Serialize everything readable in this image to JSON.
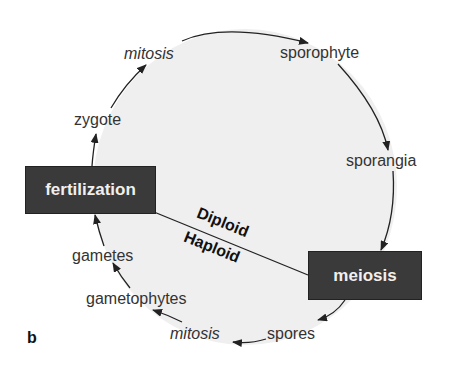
{
  "diagram": {
    "panel_label": "b",
    "process_boxes": {
      "fertilization": "fertilization",
      "meiosis": "meiosis"
    },
    "divider_labels": {
      "upper": "Diploid",
      "lower": "Haploid"
    },
    "cycle_labels": {
      "mitosis_top": "mitosis",
      "sporophyte": "sporophyte",
      "sporangia": "sporangia",
      "spores": "spores",
      "mitosis_bottom": "mitosis",
      "gametophytes": "gametophytes",
      "gametes": "gametes",
      "zygote": "zygote"
    },
    "colors": {
      "circle_fill": "#efefef",
      "box_fill": "#3a3a3a",
      "box_text": "#f0f0f0",
      "arrow": "#222222"
    }
  }
}
